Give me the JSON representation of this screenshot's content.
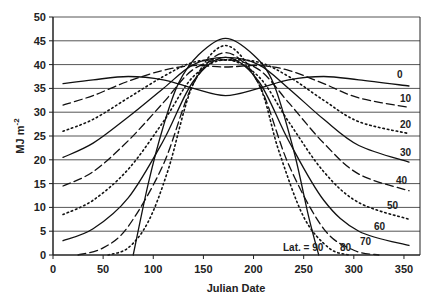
{
  "chart_data": {
    "type": "line",
    "title": "",
    "xlabel": "Julian Date",
    "ylabel": "MJ m-2",
    "xlim": [
      0,
      366
    ],
    "ylim": [
      0,
      50
    ],
    "xticks": [
      0,
      50,
      100,
      150,
      200,
      250,
      300,
      350
    ],
    "yticks": [
      0,
      5,
      10,
      15,
      20,
      25,
      30,
      35,
      40,
      45,
      50
    ],
    "grid": "horizontal",
    "legend": "inline labels at right end of curves",
    "series": [
      {
        "name": "0",
        "style": "solid",
        "x": [
          10,
          40,
          75,
          110,
          140,
          172,
          205,
          235,
          270,
          305,
          355
        ],
        "values": [
          36,
          36.8,
          37.5,
          36.8,
          35,
          33.5,
          35,
          36.8,
          37.5,
          36.8,
          35.5
        ]
      },
      {
        "name": "10",
        "style": "dash",
        "x": [
          10,
          40,
          75,
          110,
          140,
          172,
          205,
          235,
          270,
          305,
          355
        ],
        "values": [
          31.5,
          33.5,
          36.5,
          38.8,
          39.8,
          39.5,
          39.8,
          38.8,
          36,
          33,
          31
        ]
      },
      {
        "name": "20",
        "style": "dot",
        "x": [
          10,
          40,
          75,
          110,
          140,
          172,
          205,
          235,
          270,
          305,
          355
        ],
        "values": [
          26,
          28.5,
          33,
          37.5,
          40.5,
          41,
          40.5,
          37.5,
          32.5,
          28,
          25.5
        ]
      },
      {
        "name": "30",
        "style": "solid",
        "x": [
          10,
          40,
          75,
          110,
          140,
          172,
          205,
          235,
          270,
          305,
          355
        ],
        "values": [
          20.5,
          23.5,
          29,
          35,
          40,
          41.5,
          40,
          35,
          28.5,
          23,
          19.5
        ]
      },
      {
        "name": "40",
        "style": "dash",
        "x": [
          10,
          40,
          75,
          110,
          140,
          172,
          205,
          235,
          270,
          305,
          355
        ],
        "values": [
          14.5,
          17.5,
          24,
          32,
          39,
          41,
          39,
          32,
          23.5,
          17,
          13.5
        ]
      },
      {
        "name": "50",
        "style": "dot",
        "x": [
          10,
          40,
          75,
          110,
          140,
          172,
          205,
          235,
          270,
          305,
          355
        ],
        "values": [
          8.5,
          11.5,
          18,
          28,
          37.5,
          41,
          37.5,
          28,
          17.5,
          11,
          7.5
        ]
      },
      {
        "name": "60",
        "style": "solid",
        "x": [
          10,
          40,
          75,
          110,
          140,
          172,
          205,
          235,
          270,
          305,
          355
        ],
        "values": [
          3,
          5.5,
          12,
          24,
          36.5,
          41.5,
          36.5,
          24,
          11.5,
          5,
          2
        ]
      },
      {
        "name": "70",
        "style": "dash",
        "x": [
          25,
          50,
          75,
          110,
          140,
          172,
          205,
          235,
          270,
          300,
          325
        ],
        "values": [
          0,
          1.5,
          6,
          19,
          36,
          42.5,
          36,
          19,
          5.5,
          1,
          0
        ]
      },
      {
        "name": "80",
        "style": "dot",
        "x": [
          55,
          75,
          95,
          115,
          140,
          172,
          205,
          225,
          250,
          275,
          295
        ],
        "values": [
          0,
          1.5,
          7,
          18,
          36,
          44,
          36,
          22,
          8,
          1.5,
          0
        ]
      },
      {
        "name": "90",
        "style": "solid",
        "x": [
          80,
          95,
          110,
          125,
          145,
          172,
          200,
          220,
          240,
          255,
          265
        ],
        "values": [
          0,
          15,
          27,
          36,
          42,
          45.5,
          42,
          36,
          22,
          8,
          0
        ]
      }
    ]
  },
  "labels": {
    "lat_prefix": "Lat. = 90",
    "l0": "0",
    "l10": "10",
    "l20": "20",
    "l30": "30",
    "l40": "40",
    "l50": "50",
    "l60": "60",
    "l70": "70",
    "l80": "80"
  },
  "axis": {
    "xtitle": "Julian Date",
    "ytitle_main": "MJ m",
    "ytitle_sup": "-2",
    "xticks": [
      "0",
      "50",
      "100",
      "150",
      "200",
      "250",
      "300",
      "350"
    ],
    "yticks": [
      "0",
      "5",
      "10",
      "15",
      "20",
      "25",
      "30",
      "35",
      "40",
      "45",
      "50"
    ]
  }
}
